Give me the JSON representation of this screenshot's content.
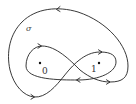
{
  "diagram": {
    "curve_label": "σ",
    "points": [
      {
        "label": "0",
        "dot": [
          40,
          63
        ],
        "text_pos": [
          42,
          74
        ]
      },
      {
        "label": "1",
        "dot": [
          99,
          63
        ],
        "text_pos": [
          91,
          72
        ]
      }
    ],
    "stroke_color": "#222222",
    "arrows": [
      {
        "position": "outer-top",
        "direction": "left"
      },
      {
        "position": "left-lobe-top",
        "direction": "right"
      },
      {
        "position": "right-lobe-top",
        "direction": "right"
      },
      {
        "position": "center-bottom",
        "direction": "left"
      },
      {
        "position": "right-lobe-bottom",
        "direction": "right"
      },
      {
        "position": "outer-bottom-left",
        "direction": "right"
      }
    ]
  }
}
